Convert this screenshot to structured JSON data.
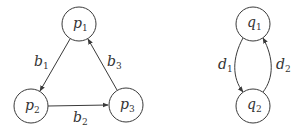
{
  "graphs": [
    {
      "name": "p-graph",
      "nodes": [
        {
          "id": "p1",
          "base": "p",
          "sub": "1",
          "cx": 79,
          "cy": 24
        },
        {
          "id": "p2",
          "base": "p",
          "sub": "2",
          "cx": 31,
          "cy": 106
        },
        {
          "id": "p3",
          "base": "p",
          "sub": "3",
          "cx": 126,
          "cy": 105
        }
      ],
      "edges": [
        {
          "id": "b1",
          "from": "p1",
          "to": "p2",
          "base": "b",
          "sub": "1"
        },
        {
          "id": "b2",
          "from": "p2",
          "to": "p3",
          "base": "b",
          "sub": "2"
        },
        {
          "id": "b3",
          "from": "p3",
          "to": "p1",
          "base": "b",
          "sub": "3"
        }
      ]
    },
    {
      "name": "q-graph",
      "nodes": [
        {
          "id": "q1",
          "base": "q",
          "sub": "1",
          "cx": 253,
          "cy": 24
        },
        {
          "id": "q2",
          "base": "q",
          "sub": "2",
          "cx": 253,
          "cy": 106
        }
      ],
      "edges": [
        {
          "id": "d1",
          "from": "q1",
          "to": "q2",
          "base": "d",
          "sub": "1"
        },
        {
          "id": "d2",
          "from": "q2",
          "to": "q1",
          "base": "d",
          "sub": "2"
        }
      ]
    }
  ],
  "colors": {
    "stroke": "#3a3a3a",
    "text": "#333333",
    "background": "#ffffff"
  }
}
